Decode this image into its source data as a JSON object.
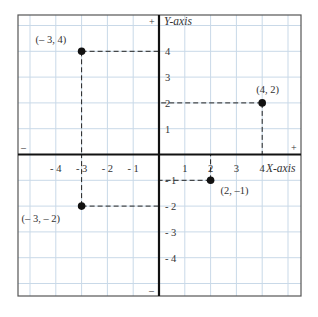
{
  "diagram": {
    "type": "cartesian-plane",
    "x_axis_label": "X-axis",
    "y_axis_label": "Y-axis",
    "x_range": [
      -5,
      5
    ],
    "y_range": [
      -5,
      5
    ],
    "x_tick_labels": [
      "- 4",
      "- 3",
      "- 2",
      "- 1",
      "1",
      "2",
      "3",
      "4"
    ],
    "x_tick_values": [
      -4,
      -3,
      -2,
      -1,
      1,
      2,
      3,
      4
    ],
    "y_tick_labels": [
      "4",
      "3",
      "2",
      "1",
      "- 1",
      "- 2",
      "- 3",
      "- 4"
    ],
    "y_tick_values": [
      4,
      3,
      2,
      1,
      -1,
      -2,
      -3,
      -4
    ],
    "sign_markers": {
      "x_negative": "–",
      "x_positive": "+",
      "y_positive": "+",
      "y_negative": "–"
    },
    "points": [
      {
        "x": -3,
        "y": 4,
        "label": "(– 3, 4)"
      },
      {
        "x": 4,
        "y": 2,
        "label": "(4, 2)"
      },
      {
        "x": 2,
        "y": -1,
        "label": "(2, –1)"
      },
      {
        "x": -3,
        "y": -2,
        "label": "(– 3, – 2)"
      }
    ],
    "colors": {
      "grid": "#c9d9e8",
      "axis": "#111111",
      "border": "#555555",
      "point": "#111111",
      "dash": "#222222"
    }
  }
}
